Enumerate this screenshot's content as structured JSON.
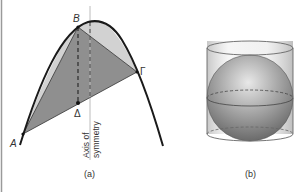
{
  "figure_a": {
    "points": {
      "A": "A",
      "B": "B",
      "Gamma": "Γ",
      "Delta": "Δ"
    },
    "axis_label_line1": "Axis of",
    "axis_label_line2": "symmetry",
    "caption": "(a)"
  },
  "figure_b": {
    "caption": "(b)"
  },
  "colors": {
    "triangle_fill": "#8f8f8f",
    "segment_fill": "#d2d2d2",
    "curve": "#1a1a1a",
    "axis_line": "#bcbcbc",
    "left_border": "#9a9a9a"
  }
}
